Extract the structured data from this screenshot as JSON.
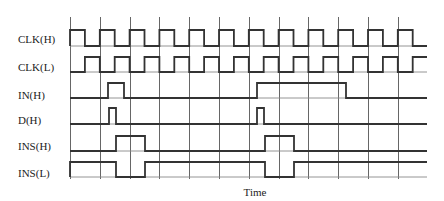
{
  "diagram": {
    "x_axis_label": "Time",
    "grid": {
      "x_start": 70,
      "period": 29.8,
      "count": 12,
      "y_top": 17,
      "y_bottom": 179
    },
    "trace_end_x": 427,
    "signals": [
      {
        "name": "CLK(H)",
        "label_y": 43,
        "high_y": 30,
        "low_y": 46,
        "initial": "low",
        "start_x": 70,
        "type": "clock",
        "first_high": true
      },
      {
        "name": "CLK(L)",
        "label_y": 71,
        "high_y": 57,
        "low_y": 72,
        "initial": "low",
        "start_x": 70,
        "type": "clock",
        "first_high": false
      },
      {
        "name": "IN(H)",
        "label_y": 99,
        "high_y": 83,
        "low_y": 98,
        "start_x": 70,
        "type": "pulses",
        "pulses": [
          [
            108,
            124
          ],
          [
            257,
            346
          ]
        ]
      },
      {
        "name": "D(H)",
        "label_y": 124,
        "high_y": 108,
        "low_y": 124,
        "start_x": 70,
        "type": "pulses",
        "pulses": [
          [
            109,
            116
          ],
          [
            257,
            264
          ]
        ]
      },
      {
        "name": "INS(H)",
        "label_y": 150,
        "high_y": 136,
        "low_y": 151,
        "start_x": 70,
        "type": "pulses",
        "pulses": [
          [
            116,
            145
          ],
          [
            265,
            294
          ]
        ]
      },
      {
        "name": "INS(L)",
        "label_y": 177,
        "high_y": 162,
        "low_y": 177,
        "start_x": 70,
        "type": "inverted_pulses",
        "pulses": [
          [
            116,
            145
          ],
          [
            265,
            294
          ]
        ]
      }
    ]
  }
}
